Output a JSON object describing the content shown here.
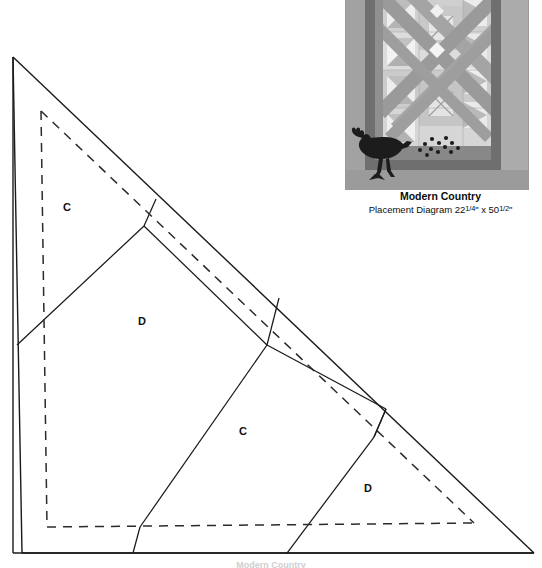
{
  "document": {
    "type": "quilt-pattern-template-page",
    "background_color": "#ffffff"
  },
  "template": {
    "name": "triangle-template",
    "description": "Large right triangle cutting template with interior piecing seam lines and dashed seam-allowance lines",
    "line_color": "#1a1a1a",
    "dash_color": "#2b2b2b",
    "labels": [
      {
        "id": "c-upper",
        "text": "C",
        "x": 63,
        "y": 202
      },
      {
        "id": "d-mid",
        "text": "D",
        "x": 138,
        "y": 316
      },
      {
        "id": "c-lower",
        "text": "C",
        "x": 239,
        "y": 426
      },
      {
        "id": "d-lower",
        "text": "D",
        "x": 364,
        "y": 483
      }
    ],
    "outline": {
      "apex": {
        "x": 13,
        "y": 57
      },
      "bottom_left": {
        "x": 22,
        "y": 553
      },
      "bottom_right": {
        "x": 534,
        "y": 553
      }
    },
    "seam_allowance": {
      "style": "dashed",
      "top": {
        "x": 41,
        "y": 111
      },
      "bottom_left": {
        "x": 47,
        "y": 527
      },
      "bottom_right": {
        "x": 474,
        "y": 523
      }
    }
  },
  "bottom_caption": {
    "text": "Modern Country",
    "note": "cut off at page edge"
  },
  "placement_diagram": {
    "title": "Modern Country",
    "subtitle_prefix": "Placement Diagram ",
    "width_whole": "22",
    "width_fraction": "1/4",
    "width_unit": "\"",
    "separator": " x ",
    "height_whole": "50",
    "height_fraction": "1/2",
    "height_unit": "\"",
    "subtitle_full": "Placement Diagram 22¼\" x 50½\"",
    "motif": "rooster",
    "colors": {
      "outer_border": "#a8a8a8",
      "inner_border": "#8f8f8f",
      "dark_sash": "#6f6f6f",
      "mid_gray": "#b5b5b5",
      "light_gray": "#d8d8d8",
      "white_patch": "#f2f2f2",
      "rooster": "#1c1c1c",
      "bottom_band": "#9b9b9b"
    }
  }
}
